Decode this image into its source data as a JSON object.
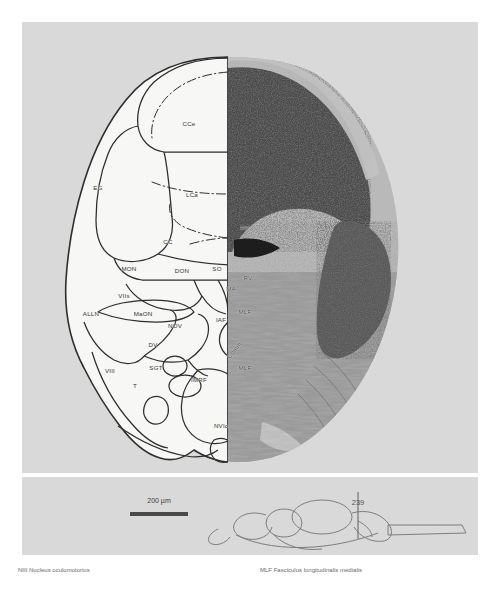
{
  "figure": {
    "type": "neuroanatomical-section",
    "section_number": "239",
    "scalebar": {
      "label": "200 µm",
      "length_px": 58
    },
    "panels": {
      "main": "transverse-brain-section-half-drawing-half-photomicrograph",
      "inset": "lateral-brain-outline-with-section-level-marker"
    },
    "labels": [
      {
        "id": "CCe",
        "x": 189,
        "y": 123,
        "rot": false
      },
      {
        "id": "EG",
        "x": 98,
        "y": 187,
        "rot": false
      },
      {
        "id": "LCa",
        "x": 192,
        "y": 194,
        "rot": false
      },
      {
        "id": "CC",
        "x": 168,
        "y": 241,
        "rot": false
      },
      {
        "id": "RV",
        "x": 245,
        "y": 227,
        "rot": false
      },
      {
        "id": "MON",
        "x": 129,
        "y": 268,
        "rot": false
      },
      {
        "id": "DON",
        "x": 182,
        "y": 270,
        "rot": false
      },
      {
        "id": "SO",
        "x": 217,
        "y": 268,
        "rot": false
      },
      {
        "id": "RV",
        "x": 248,
        "y": 277,
        "rot": false
      },
      {
        "id": "MA",
        "x": 231,
        "y": 288,
        "rot": false
      },
      {
        "id": "MLF",
        "x": 245,
        "y": 311,
        "rot": false
      },
      {
        "id": "IAF",
        "x": 221,
        "y": 319,
        "rot": false
      },
      {
        "id": "VIIs",
        "x": 124,
        "y": 295,
        "rot": false
      },
      {
        "id": "ALLN",
        "x": 91,
        "y": 313,
        "rot": false
      },
      {
        "id": "MaON",
        "x": 143,
        "y": 313,
        "rot": false
      },
      {
        "id": "NOV",
        "x": 175,
        "y": 325,
        "rot": false
      },
      {
        "id": "DV",
        "x": 153,
        "y": 344,
        "rot": false
      },
      {
        "id": "SGT",
        "x": 156,
        "y": 367,
        "rot": false
      },
      {
        "id": "VIII",
        "x": 110,
        "y": 370,
        "rot": false
      },
      {
        "id": "T",
        "x": 135,
        "y": 385,
        "rot": false
      },
      {
        "id": "IMRF",
        "x": 199,
        "y": 379,
        "rot": false
      },
      {
        "id": "Comm",
        "x": 234,
        "y": 350,
        "rot": true
      },
      {
        "id": "MLF",
        "x": 245,
        "y": 367,
        "rot": false
      },
      {
        "id": "NVIc",
        "x": 221,
        "y": 425,
        "rot": false
      }
    ]
  },
  "caption": {
    "columns": [
      "NIII Nucleus     oculomotorius",
      "MLF  Fasciculus longitudinalis medialis"
    ]
  },
  "colors": {
    "panel_background": "#d9d9d9",
    "drawing_fill": "#f5f5f3",
    "outline": "#2e2e2e",
    "label_text": "#3a3a3a",
    "photo_dark": "#3a3a3a",
    "photo_mid": "#8a8a8a"
  }
}
